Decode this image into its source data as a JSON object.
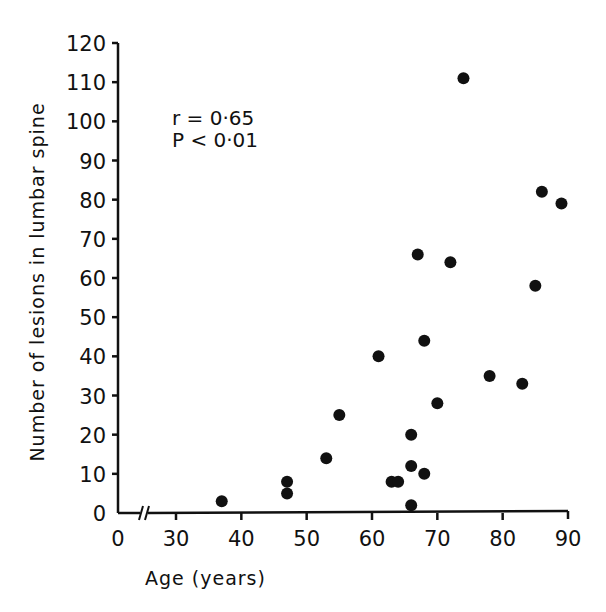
{
  "chart_data": {
    "type": "scatter",
    "title": "",
    "xlabel": "Age (years)",
    "ylabel": "Number of lesions in lumbar spine",
    "xlim": [
      0,
      90
    ],
    "ylim": [
      0,
      120
    ],
    "x_axis_break": "between 0 and 30",
    "x_ticks": [
      0,
      30,
      40,
      50,
      60,
      70,
      80,
      90
    ],
    "x_tick_labels": [
      "0",
      "30",
      "40",
      "50",
      "60",
      "70",
      "80",
      "90"
    ],
    "y_ticks": [
      0,
      10,
      20,
      30,
      40,
      50,
      60,
      70,
      80,
      90,
      100,
      110,
      120
    ],
    "y_tick_labels": [
      "0",
      "10",
      "20",
      "30",
      "40",
      "50",
      "60",
      "70",
      "80",
      "90",
      "100",
      "110",
      "120"
    ],
    "grid": false,
    "legend": null,
    "annotations": [
      "r = 0·65",
      "P < 0·01"
    ],
    "points": [
      {
        "x": 37,
        "y": 3
      },
      {
        "x": 47,
        "y": 8
      },
      {
        "x": 47,
        "y": 5
      },
      {
        "x": 53,
        "y": 14
      },
      {
        "x": 55,
        "y": 25
      },
      {
        "x": 61,
        "y": 40
      },
      {
        "x": 63,
        "y": 8
      },
      {
        "x": 64,
        "y": 8
      },
      {
        "x": 66,
        "y": 2
      },
      {
        "x": 66,
        "y": 12
      },
      {
        "x": 66,
        "y": 20
      },
      {
        "x": 67,
        "y": 66
      },
      {
        "x": 68,
        "y": 10
      },
      {
        "x": 68,
        "y": 44
      },
      {
        "x": 70,
        "y": 28
      },
      {
        "x": 72,
        "y": 64
      },
      {
        "x": 74,
        "y": 111
      },
      {
        "x": 78,
        "y": 35
      },
      {
        "x": 83,
        "y": 33
      },
      {
        "x": 85,
        "y": 58
      },
      {
        "x": 86,
        "y": 82
      },
      {
        "x": 89,
        "y": 79
      }
    ]
  },
  "labels": {
    "xlabel": "Age (years)",
    "ylabel": "Number of lesions in lumbar spine",
    "annotation_r": "r = 0·65",
    "annotation_p": "P < 0·01"
  }
}
